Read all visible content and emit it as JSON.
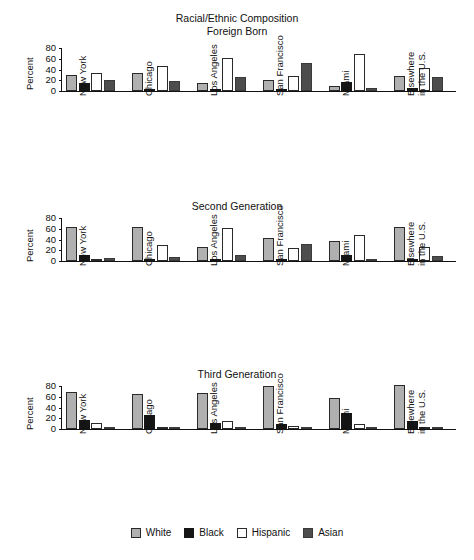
{
  "chart_data": {
    "type": "bar",
    "title": "Racial/Ethnic Composition",
    "subtitle": "Foreign Born",
    "xlabel": "",
    "ylabel": "Percent",
    "ylim": [
      0,
      80
    ],
    "yticks": [
      0,
      20,
      40,
      60,
      80
    ],
    "grid": false,
    "legend_position": "bottom",
    "categories": [
      "New York",
      "Chicago",
      "Los Angeles",
      "San Francisco",
      "Miami",
      "Elsewhere in the U.S."
    ],
    "category_lines": [
      [
        "New York",
        ""
      ],
      [
        "Chicago",
        ""
      ],
      [
        "Los Angeles",
        ""
      ],
      [
        "San Francisco",
        ""
      ],
      [
        "Miami",
        ""
      ],
      [
        "Elsewhere",
        "in the U.S."
      ]
    ],
    "legend": [
      "White",
      "Black",
      "Hispanic",
      "Asian"
    ],
    "series_colors": {
      "White": "#b0b0b0",
      "Black": "#161616",
      "Hispanic": "#ffffff",
      "Asian": "#4d4d4d"
    },
    "panels": [
      {
        "title": "Racial/Ethnic Composition",
        "subtitle": "Foreign Born",
        "ylabel": "Percent",
        "series": [
          {
            "name": "White",
            "values": [
              30,
              34,
              14,
              20,
              10,
              28
            ]
          },
          {
            "name": "Black",
            "values": [
              15,
              2,
              1,
              4,
              16,
              5
            ]
          },
          {
            "name": "Hispanic",
            "values": [
              34,
              46,
              62,
              28,
              69,
              43
            ]
          },
          {
            "name": "Asian",
            "values": [
              20,
              19,
              26,
              52,
              5,
              26
            ]
          }
        ]
      },
      {
        "title": "Second Generation",
        "subtitle": "",
        "ylabel": "Percent",
        "series": [
          {
            "name": "White",
            "values": [
              64,
              63,
              26,
              43,
              38,
              63
            ]
          },
          {
            "name": "Black",
            "values": [
              11,
              3,
              1,
              1,
              12,
              3
            ]
          },
          {
            "name": "Hispanic",
            "values": [
              2,
              29,
              61,
              24,
              48,
              27
            ]
          },
          {
            "name": "Asian",
            "values": [
              6,
              7,
              12,
              31,
              2,
              10
            ]
          }
        ]
      },
      {
        "title": "Third Generation",
        "subtitle": "",
        "ylabel": "Percent",
        "series": [
          {
            "name": "White",
            "values": [
              68,
              65,
              67,
              80,
              58,
              82
            ]
          },
          {
            "name": "Black",
            "values": [
              17,
              26,
              12,
              10,
              30,
              14
            ]
          },
          {
            "name": "Hispanic",
            "values": [
              11,
              4,
              14,
              6,
              9,
              4
            ]
          },
          {
            "name": "Asian",
            "values": [
              0,
              0,
              1,
              3,
              0,
              0
            ]
          }
        ]
      }
    ]
  }
}
